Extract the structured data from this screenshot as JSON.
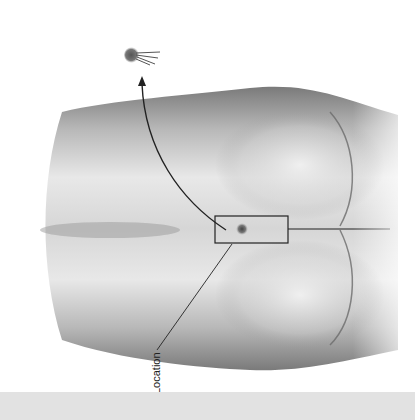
{
  "figure": {
    "annotations": [
      {
        "id": "location",
        "label": "Location"
      }
    ],
    "elements": {
      "highlight_box": "inset-rectangle",
      "lesion": "dark-dot",
      "extracted_object": "cyst-with-hairs",
      "arrow": "curved-arrow"
    },
    "colors": {
      "skin_light": "#ececec",
      "skin_mid": "#bdbdbd",
      "skin_dark": "#8a8a8a",
      "line": "#222222",
      "footer_band": "#e2e2e2"
    }
  }
}
